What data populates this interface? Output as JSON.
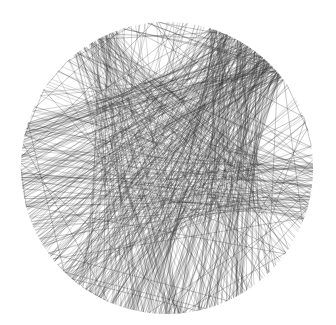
{
  "artwork": {
    "description": "Circular string-art pattern of dark grey straight lines connecting points on a circle, densest fan near the upper right",
    "background": "#ffffff",
    "stroke_color": "#2a2a2a",
    "circle": {
      "cx": 167,
      "cy": 168,
      "r": 146
    },
    "fans": [
      {
        "hub_angle_deg": -55,
        "spread_deg": 150,
        "count": 260,
        "hub_jitter_deg": 18,
        "alpha": 0.35
      },
      {
        "hub_angle_deg": -120,
        "spread_deg": 120,
        "count": 90,
        "hub_jitter_deg": 10,
        "alpha": 0.3
      },
      {
        "hub_angle_deg": 10,
        "spread_deg": 100,
        "count": 70,
        "hub_jitter_deg": 12,
        "alpha": 0.3
      },
      {
        "hub_angle_deg": 110,
        "spread_deg": 90,
        "count": 80,
        "hub_jitter_deg": 25,
        "alpha": 0.3
      }
    ],
    "random_chords": 70,
    "seed": 7
  }
}
